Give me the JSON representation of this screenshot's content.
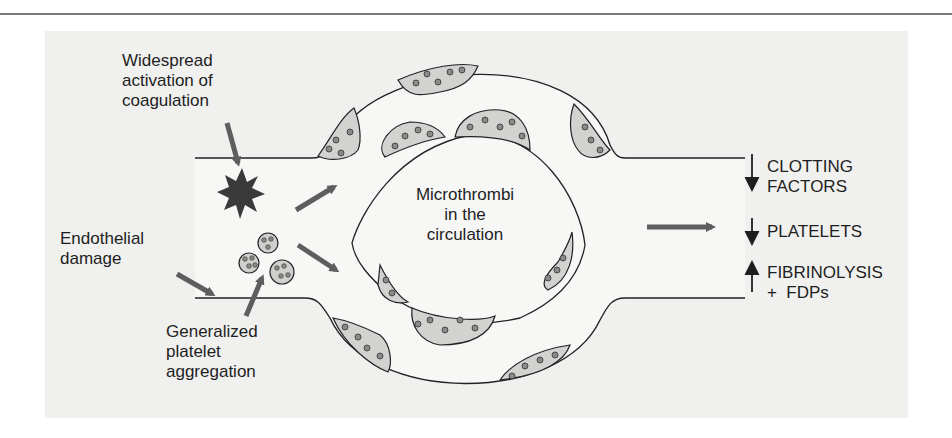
{
  "figure": {
    "colors": {
      "background": "#f0f0ef",
      "vessel_wall": "#222222",
      "vessel_lumen": "#f6f6f5",
      "thrombus_fill": "#d2d2d0",
      "platelet_dot": "#8a8a88",
      "arrow": "#5e5e5e",
      "star": "#3a3a3a"
    },
    "labels": {
      "widespread": [
        "Widespread",
        "activation of",
        "coagulation"
      ],
      "endothelial": [
        "Endothelial",
        "damage"
      ],
      "generalized": [
        "Generalized",
        "platelet",
        "aggregation"
      ],
      "microthrombi": [
        "Microthrombi",
        "in the",
        "circulation"
      ]
    },
    "outcomes": [
      {
        "direction": "down",
        "lines": [
          "CLOTTING",
          "FACTORS"
        ]
      },
      {
        "direction": "down",
        "lines": [
          "PLATELETS"
        ]
      },
      {
        "direction": "up",
        "lines": [
          "FIBRINOLYSIS",
          "+  FDPs"
        ]
      }
    ]
  }
}
